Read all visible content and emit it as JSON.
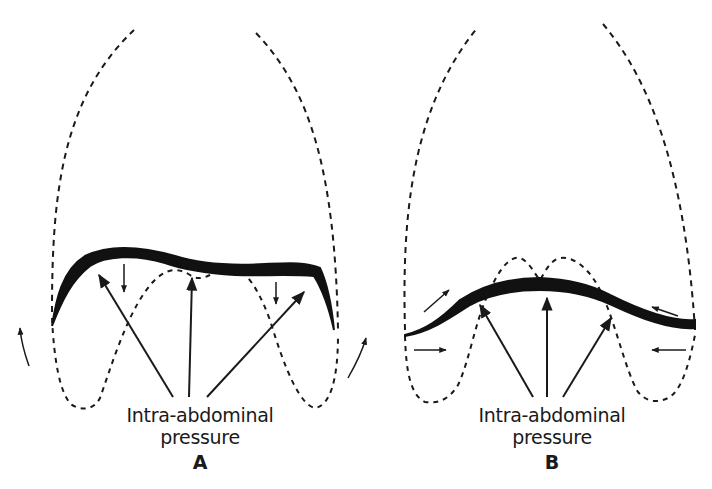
{
  "figure": {
    "panels": [
      {
        "id": "A",
        "letter": "A",
        "label_line1": "Intra-abdominal",
        "label_line2": "pressure",
        "arrows": {
          "pressure_arrows": 3,
          "small_down_arrows": 2,
          "side_curved_arrows": 2
        }
      },
      {
        "id": "B",
        "letter": "B",
        "label_line1": "Intra-abdominal",
        "label_line2": "pressure",
        "arrows": {
          "pressure_arrows": 3,
          "diaphragm_tangent_arrows": 2,
          "horizontal_inward_arrows": 2
        }
      }
    ],
    "colors": {
      "ink": "#1a1a1a",
      "background": "#ffffff"
    }
  }
}
